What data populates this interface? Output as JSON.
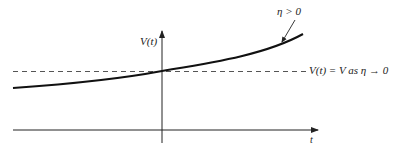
{
  "diagram": {
    "y_axis_label": "V(t)",
    "x_axis_label": "t",
    "curve_label": "η > 0",
    "dashed_line_label": "V(t) = V as η → 0",
    "colors": {
      "curve": "#111111",
      "axes": "#222222",
      "dashed": "#555555"
    }
  }
}
